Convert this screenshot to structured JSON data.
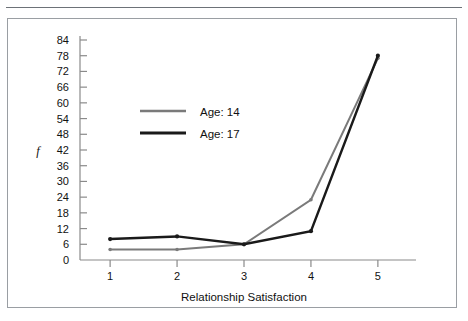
{
  "figure": {
    "border_color": "#9a9ea3",
    "background": "#ffffff",
    "rule_color": "#6d7278"
  },
  "chart_data": {
    "type": "line",
    "title": "",
    "subtitle": "",
    "xlabel": "Relationship Satisfaction",
    "ylabel": "f",
    "categories": [
      "1",
      "2",
      "3",
      "4",
      "5"
    ],
    "x": [
      1,
      2,
      3,
      4,
      5
    ],
    "xlim": [
      0.55,
      5.45
    ],
    "ylim": [
      0,
      84
    ],
    "xticks": [
      "1",
      "2",
      "3",
      "4",
      "5"
    ],
    "yticks": [
      "0",
      "6",
      "12",
      "18",
      "24",
      "30",
      "36",
      "42",
      "48",
      "54",
      "60",
      "66",
      "72",
      "78",
      "84"
    ],
    "ytick_values": [
      0,
      6,
      12,
      18,
      24,
      30,
      36,
      42,
      48,
      54,
      60,
      66,
      72,
      78,
      84
    ],
    "grid": false,
    "legend_position": "upper-left-inside",
    "series": [
      {
        "name": "Age: 14",
        "color": "#7a7a7a",
        "values": [
          4,
          4,
          6,
          23,
          77
        ]
      },
      {
        "name": "Age: 17",
        "color": "#1a1a1a",
        "values": [
          8,
          9,
          6,
          11,
          78
        ]
      }
    ],
    "legend": [
      {
        "label": "Age: 14",
        "color": "#7a7a7a"
      },
      {
        "label": "Age: 17",
        "color": "#1a1a1a"
      }
    ],
    "axis_color": "#8a8a8a",
    "marker": "dot"
  }
}
